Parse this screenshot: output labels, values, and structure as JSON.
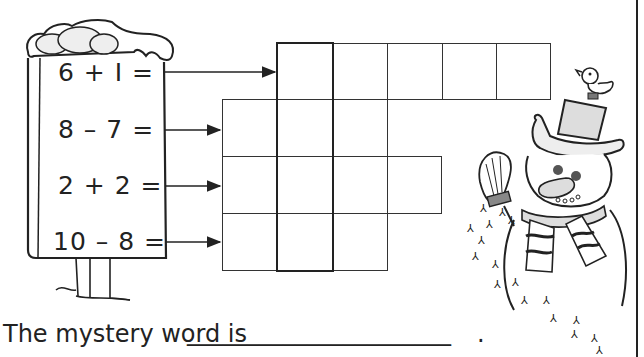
{
  "worksheet": {
    "equations": [
      {
        "text": "6 + I =",
        "row": 1
      },
      {
        "text": "8 – 7 =",
        "row": 2
      },
      {
        "text": "2 + 2 =",
        "row": 3
      },
      {
        "text": "10 – 8 =",
        "row": 4
      }
    ],
    "grid": {
      "rows": [
        {
          "row": 1,
          "start_col": 2,
          "cells": 5
        },
        {
          "row": 2,
          "start_col": 1,
          "cells": 3
        },
        {
          "row": 3,
          "start_col": 1,
          "cells": 4
        },
        {
          "row": 4,
          "start_col": 1,
          "cells": 3
        }
      ],
      "highlight_column": 2
    },
    "answer_prompt": "The mystery word is",
    "answer_blank": "______________________",
    "answer_end": ".",
    "illustrations": [
      "snow-covered-post",
      "snowman-with-top-hat-and-scarf",
      "bird-on-hat",
      "broom",
      "bird-footprints"
    ]
  },
  "colors": {
    "ink": "#222222",
    "paper": "#ffffff"
  }
}
